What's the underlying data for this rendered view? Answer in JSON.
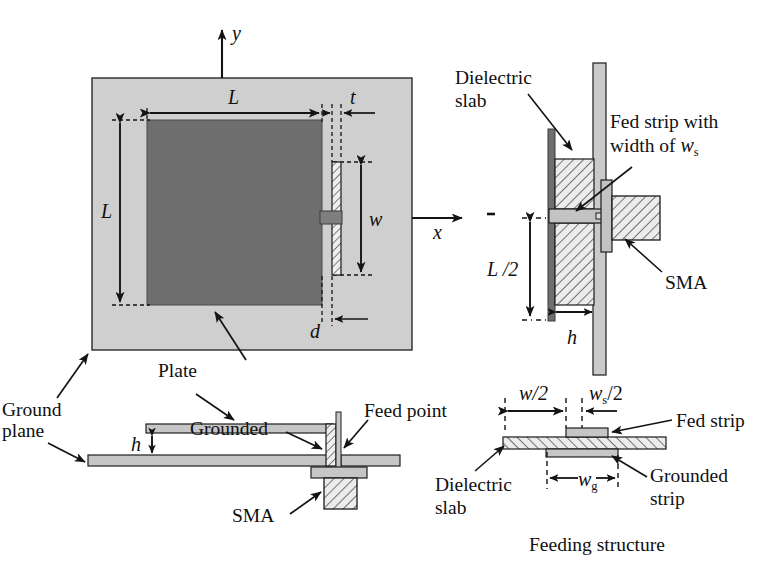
{
  "figure": {
    "type": "engineering-diagram",
    "caption": "Feeding structure"
  },
  "labels": {
    "axis_y": "y",
    "axis_x": "x",
    "dim_L_top": "L",
    "dim_L_left": "L",
    "dim_t": "t",
    "dim_w": "w",
    "dim_d": "d",
    "dim_h_right": "h",
    "dim_h_bottom": "h",
    "dim_L_half": "L /2",
    "dim_w_half": "w/2",
    "dim_ws_half_a": "w",
    "dim_ws_half_b": "s",
    "dim_ws_half_c": "/2",
    "dim_wg_a": "w",
    "dim_wg_b": "g",
    "ground_plane": "Ground\nplane",
    "ground_plane_l1": "Ground",
    "ground_plane_l2": "plane",
    "plate": "Plate",
    "dielectric_slab_l1": "Dielectric",
    "dielectric_slab_l2": "slab",
    "fed_strip_width_l1": "Fed strip with",
    "fed_strip_width_l2a": "width of ",
    "fed_strip_width_l2b": "w",
    "fed_strip_width_l2c": "s",
    "sma_right": "SMA",
    "sma_bottom": "SMA",
    "grounded": "Grounded",
    "feed_point": "Feed point",
    "fed_strip": "Fed strip",
    "grounded_strip_l1": "Grounded",
    "grounded_strip_l2": "strip",
    "dielectric_slab_b_l1": "Dielectric",
    "dielectric_slab_b_l2": "slab",
    "feeding_structure": "Feeding structure"
  },
  "colors": {
    "ground_plane_fill": "#cfcfcf",
    "plate_fill": "#6e6e6e",
    "metal_fill": "#c3c3c3",
    "hatch_fill": "#e9e9e9",
    "stroke": "#1a1a1a",
    "dash": "#1a1a1a",
    "background": "#ffffff"
  },
  "views": {
    "top_left": "Front view: square plate on ground plane with shorting/feed strip",
    "top_right": "Side view: dielectric slab, fed strip, SMA connector",
    "bottom_left": "Side view: ground plane, plate, grounded strip, SMA",
    "bottom_right": "Feeding structure cross-section detail"
  }
}
